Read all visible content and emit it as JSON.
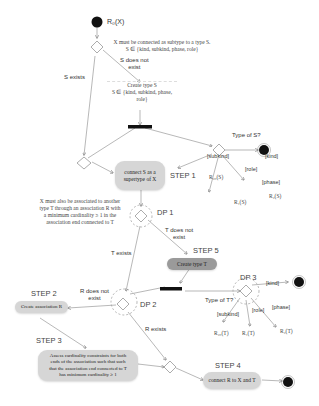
{
  "diagram": {
    "start_label": "R₀(X)",
    "note_top": "X must be connected as subtype to a type S.\nS ∈ {kind, subkind, phase, role}",
    "s_does_not_exist": "S does not\nexist",
    "s_exists": "S exists",
    "create_type_s": "Create type S\nS ∈ {kind, subkind, phase,\nrole}",
    "type_of_s": "Type of S?",
    "s_guards": {
      "subkind": "[subkind]",
      "kind": "[kind]",
      "role": "[role]",
      "phase": "[phase]"
    },
    "s_results": {
      "subkind": "R₂₀(S)",
      "role": "R₁(S)",
      "phase": "R₂(S)"
    },
    "step1": {
      "label": "STEP 1",
      "text": "connect S as a\nsupertype of X"
    },
    "dp1": {
      "label": "DP 1"
    },
    "note_mid": "X must also be associated to another\ntype T through an association R with\na minimum cardinality ≥ 1 in the\nassociation end connected to T",
    "t_exists": "T exists",
    "t_does_not_exist": "T does not\nexist",
    "step5": {
      "label": "STEP 5",
      "text": "Create type T"
    },
    "dp2": {
      "label": "DP 2"
    },
    "r_does_not_exist": "R does not\nexist",
    "r_exists": "R exists",
    "step2": {
      "label": "STEP 2",
      "text": "Create association R"
    },
    "dp3": {
      "label": "DP 3"
    },
    "type_of_t": "Type of T?",
    "t_guards": {
      "kind": "[kind]",
      "subkind": "[subkind]",
      "role": "[role]",
      "phase": "[phase]"
    },
    "t_results": {
      "subkind": "R₂₀(T)",
      "role": "R₁(T)",
      "phase": "R₂(T)"
    },
    "step3": {
      "label": "STEP 3",
      "text": "Assess cardinality constraints for both\nends of the association such that such\nthat the association end connected to T\nhas minimum cardinality ≥ 1"
    },
    "step4": {
      "label": "STEP 4",
      "text": "connect R to X and T"
    }
  }
}
